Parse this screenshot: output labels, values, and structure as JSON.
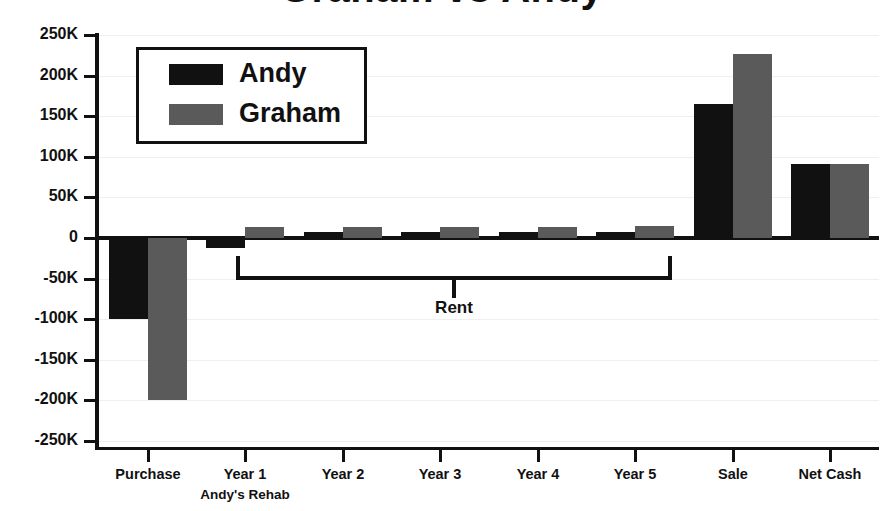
{
  "chart_data": {
    "type": "bar",
    "title": "Graham vs Andy",
    "xlabel": "",
    "ylabel": "",
    "ylim": [
      -250000,
      250000
    ],
    "grid": true,
    "legend_position": "upper-left-inset",
    "categories": [
      "Purchase",
      "Year 1",
      "Year 2",
      "Year 3",
      "Year 4",
      "Year 5",
      "Sale",
      "Net Cash"
    ],
    "category_sublabels": [
      "",
      "Andy's Rehab",
      "",
      "",
      "",
      "",
      "",
      ""
    ],
    "series": [
      {
        "name": "Andy",
        "color": "#111111",
        "values": [
          -100000,
          -12000,
          7000,
          7000,
          7000,
          7000,
          165000,
          91000
        ]
      },
      {
        "name": "Graham",
        "color": "#5a5a5a",
        "values": [
          -200000,
          13000,
          13000,
          14000,
          14000,
          15000,
          227000,
          91000
        ]
      }
    ],
    "ticks": [
      {
        "value": 250000,
        "label": "250K"
      },
      {
        "value": 200000,
        "label": "200K"
      },
      {
        "value": 150000,
        "label": "150K"
      },
      {
        "value": 100000,
        "label": "100K"
      },
      {
        "value": 50000,
        "label": "50K"
      },
      {
        "value": 0,
        "label": "0"
      },
      {
        "value": -50000,
        "label": "-50K"
      },
      {
        "value": -100000,
        "label": "-100K"
      },
      {
        "value": -150000,
        "label": "-150K"
      },
      {
        "value": -200000,
        "label": "-200K"
      },
      {
        "value": -250000,
        "label": "-250K"
      }
    ],
    "annotations": [
      {
        "label": "Rent",
        "spans": [
          "Year 1",
          "Year 5"
        ],
        "style": "bracket"
      }
    ]
  },
  "legend": {
    "entries": [
      {
        "label": "Andy"
      },
      {
        "label": "Graham"
      }
    ]
  }
}
